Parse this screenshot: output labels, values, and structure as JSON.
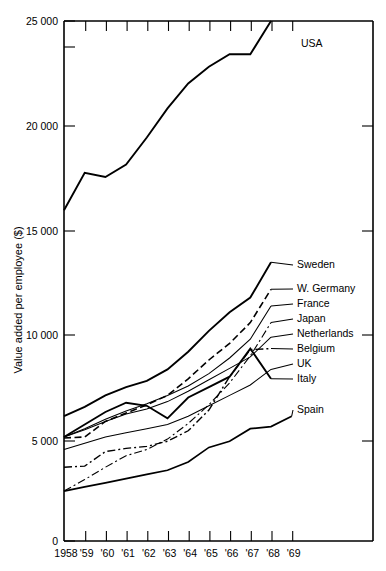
{
  "chart_data": {
    "type": "line",
    "title": "",
    "subtitle": "",
    "xlabel": "",
    "ylabel": "Value added per employee ($)",
    "grid": false,
    "legend_position": "right-inline-labels",
    "x": [
      1958,
      1959,
      1960,
      1961,
      1962,
      1963,
      1964,
      1965,
      1966,
      1967,
      1968,
      1969
    ],
    "xtick_labels": [
      "1958",
      "'59",
      "'60",
      "'61",
      "'62",
      "'63",
      "'64",
      "'65",
      "'66",
      "'67",
      "'68",
      "'69"
    ],
    "xlim": [
      1958,
      1969.6
    ],
    "ylim": [
      0,
      25000
    ],
    "ytick_labels": [
      "0",
      "5 000",
      "10 000",
      "15 000",
      "20 000",
      "25 000"
    ],
    "ytick_values": [
      0,
      5000,
      10000,
      15000,
      20000,
      25000
    ],
    "y_axis_break_note": "",
    "series": [
      {
        "name": "USA",
        "label": "USA",
        "style": "solid",
        "width": 1.9,
        "values": [
          15900,
          17700,
          17500,
          18100,
          19400,
          20800,
          22000,
          22800,
          23400,
          23400,
          25000,
          null
        ]
      },
      {
        "name": "Sweden",
        "label": "Sweden",
        "style": "solid",
        "width": 1.9,
        "values": [
          6000,
          6450,
          7000,
          7400,
          7700,
          8250,
          9100,
          10100,
          11000,
          11700,
          13400,
          null
        ]
      },
      {
        "name": "W. Germany",
        "label": "W. Germany",
        "style": "dashed",
        "width": 1.6,
        "values": [
          4950,
          5000,
          5750,
          6150,
          6550,
          7000,
          7800,
          8700,
          9500,
          10500,
          12100,
          null
        ]
      },
      {
        "name": "France",
        "label": "France",
        "style": "solid",
        "width": 1.05,
        "values": [
          5000,
          5400,
          5850,
          6250,
          6600,
          7000,
          7450,
          8050,
          8800,
          9700,
          11300,
          null
        ]
      },
      {
        "name": "Japan",
        "label": "Japan",
        "style": "dashdot",
        "width": 1.1,
        "values": [
          2400,
          2950,
          3550,
          4100,
          4400,
          4900,
          5650,
          6550,
          7600,
          8900,
          10500,
          null
        ]
      },
      {
        "name": "Netherlands",
        "label": "Netherlands",
        "style": "solid",
        "width": 1.05,
        "values": [
          5000,
          5350,
          5750,
          6100,
          6350,
          6700,
          7200,
          7750,
          8300,
          8850,
          9800,
          null
        ]
      },
      {
        "name": "Belgium",
        "label": "Belgium",
        "style": "dashdot",
        "width": 1.4,
        "values": [
          3550,
          3600,
          4300,
          4450,
          4550,
          4800,
          5300,
          6300,
          7900,
          9200,
          9250,
          null
        ]
      },
      {
        "name": "UK",
        "label": "UK",
        "style": "solid",
        "width": 1.05,
        "values": [
          4400,
          4700,
          5000,
          5200,
          5400,
          5600,
          6000,
          6500,
          7000,
          7500,
          8250,
          null
        ]
      },
      {
        "name": "Italy",
        "label": "Italy",
        "style": "solid",
        "width": 1.9,
        "values": [
          5000,
          5600,
          6200,
          6650,
          6500,
          5900,
          6900,
          7400,
          7900,
          9250,
          7800,
          null
        ]
      },
      {
        "name": "Spain",
        "label": "Spain",
        "style": "solid",
        "width": 1.7,
        "values": [
          2400,
          2600,
          2800,
          3000,
          3200,
          3400,
          3800,
          4500,
          4800,
          5400,
          5500,
          6000
        ]
      }
    ],
    "series_label_positions": [
      {
        "name": "USA",
        "x": 301,
        "y": 47
      },
      {
        "name": "Sweden",
        "x": 297,
        "y": 268
      },
      {
        "name": "W. Germany",
        "x": 297,
        "y": 292
      },
      {
        "name": "France",
        "x": 297,
        "y": 307
      },
      {
        "name": "Japan",
        "x": 297,
        "y": 322
      },
      {
        "name": "Netherlands",
        "x": 297,
        "y": 337
      },
      {
        "name": "Belgium",
        "x": 297,
        "y": 352
      },
      {
        "name": "UK",
        "x": 297,
        "y": 367
      },
      {
        "name": "Italy",
        "x": 297,
        "y": 382
      },
      {
        "name": "Spain",
        "x": 297,
        "y": 413
      }
    ]
  }
}
